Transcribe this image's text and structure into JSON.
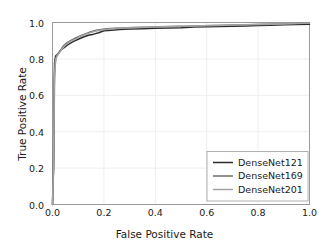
{
  "chart_data": {
    "type": "line",
    "title": "",
    "xlabel": "False Positive Rate",
    "ylabel": "True Positive Rate",
    "xlim": [
      0.0,
      1.0
    ],
    "ylim": [
      0.0,
      1.0
    ],
    "xticks": [
      "0.0",
      "0.2",
      "0.4",
      "0.6",
      "0.8",
      "1.0"
    ],
    "xtick_values": [
      0.0,
      0.2,
      0.4,
      0.6,
      0.8,
      1.0
    ],
    "yticks": [
      "0.0",
      "0.2",
      "0.4",
      "0.6",
      "0.8",
      "1.0"
    ],
    "ytick_values": [
      0.0,
      0.2,
      0.4,
      0.6,
      0.8,
      1.0
    ],
    "grid": true,
    "grid_color": "#eeeeee",
    "legend_position": "lower right",
    "series": [
      {
        "name": "DenseNet121",
        "color": "#2b2b2b",
        "linewidth": 1.5,
        "x": [
          0.0,
          0.004,
          0.006,
          0.008,
          0.012,
          0.02,
          0.03,
          0.045,
          0.06,
          0.08,
          0.1,
          0.12,
          0.14,
          0.16,
          0.18,
          0.2,
          0.23,
          0.26,
          0.3,
          0.35,
          0.4,
          0.45,
          0.5,
          0.55,
          0.6,
          0.65,
          0.7,
          0.75,
          0.8,
          0.85,
          0.9,
          0.95,
          1.0
        ],
        "y": [
          0.0,
          0.2,
          0.6,
          0.78,
          0.815,
          0.825,
          0.845,
          0.862,
          0.878,
          0.895,
          0.908,
          0.92,
          0.93,
          0.936,
          0.944,
          0.955,
          0.958,
          0.962,
          0.964,
          0.966,
          0.968,
          0.97,
          0.971,
          0.975,
          0.977,
          0.978,
          0.979,
          0.981,
          0.983,
          0.985,
          0.987,
          0.989,
          0.99
        ]
      },
      {
        "name": "DenseNet169",
        "color": "#6e6e6e",
        "linewidth": 1.5,
        "x": [
          0.0,
          0.005,
          0.008,
          0.013,
          0.02,
          0.028,
          0.04,
          0.055,
          0.07,
          0.09,
          0.11,
          0.13,
          0.15,
          0.17,
          0.19,
          0.21,
          0.24,
          0.27,
          0.31,
          0.36,
          0.41,
          0.46,
          0.52,
          0.58,
          0.64,
          0.7,
          0.76,
          0.82,
          0.88,
          0.94,
          1.0
        ],
        "y": [
          0.0,
          0.24,
          0.72,
          0.805,
          0.822,
          0.84,
          0.868,
          0.888,
          0.9,
          0.915,
          0.928,
          0.939,
          0.95,
          0.958,
          0.962,
          0.966,
          0.969,
          0.97,
          0.972,
          0.974,
          0.976,
          0.978,
          0.98,
          0.982,
          0.984,
          0.986,
          0.988,
          0.99,
          0.992,
          0.995,
          0.998
        ]
      },
      {
        "name": "DenseNet201",
        "color": "#a3a3a3",
        "linewidth": 1.5,
        "x": [
          0.0,
          0.004,
          0.007,
          0.011,
          0.018,
          0.026,
          0.038,
          0.05,
          0.065,
          0.085,
          0.105,
          0.125,
          0.145,
          0.165,
          0.185,
          0.205,
          0.235,
          0.265,
          0.3,
          0.34,
          0.39,
          0.44,
          0.5,
          0.56,
          0.62,
          0.68,
          0.74,
          0.8,
          0.86,
          0.92,
          1.0
        ],
        "y": [
          0.0,
          0.22,
          0.66,
          0.79,
          0.818,
          0.832,
          0.856,
          0.876,
          0.892,
          0.906,
          0.921,
          0.933,
          0.943,
          0.952,
          0.957,
          0.962,
          0.966,
          0.968,
          0.971,
          0.973,
          0.975,
          0.977,
          0.979,
          0.981,
          0.983,
          0.985,
          0.987,
          0.989,
          0.991,
          0.993,
          0.997
        ]
      }
    ]
  },
  "axes": {
    "xlabel": "False Positive Rate",
    "ylabel": "True Positive Rate"
  },
  "legend": {
    "items": [
      {
        "label": "DenseNet121"
      },
      {
        "label": "DenseNet169"
      },
      {
        "label": "DenseNet201"
      }
    ]
  }
}
